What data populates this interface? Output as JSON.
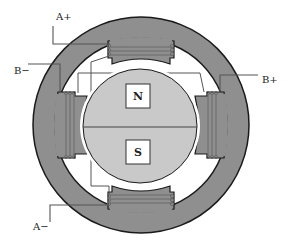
{
  "diagram": {
    "colors": {
      "stator": "#8f8f8f",
      "rotor": "#c9c9c9",
      "outline": "#1a1a1a",
      "wire": "#555555",
      "coil": "#6a6a6a",
      "background": "#ffffff",
      "pole_box": "#ffffff"
    },
    "terminals": [
      {
        "id": "a_plus",
        "label": "A+"
      },
      {
        "id": "b_minus",
        "label": "B−"
      },
      {
        "id": "b_plus",
        "label": "B+"
      },
      {
        "id": "a_minus",
        "label": "A−"
      }
    ],
    "rotor": {
      "north_label": "N",
      "south_label": "S"
    },
    "stator_poles": [
      "top",
      "right",
      "bottom",
      "left"
    ],
    "windings": {
      "phase_a": [
        "top",
        "bottom"
      ],
      "phase_b": [
        "left",
        "right"
      ]
    }
  }
}
